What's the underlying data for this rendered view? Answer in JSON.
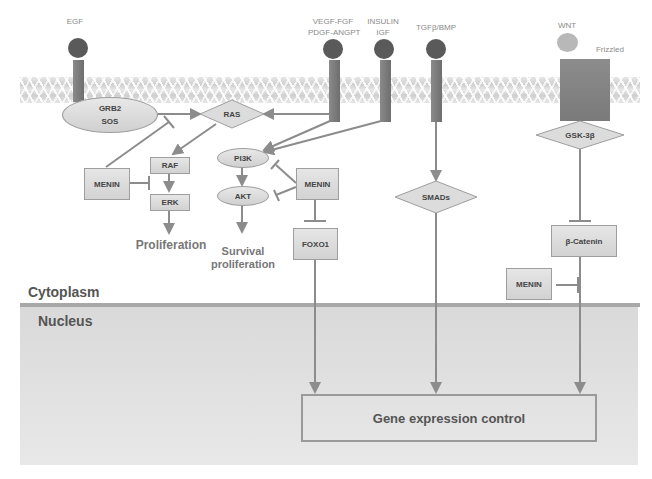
{
  "compartments": {
    "cytoplasm_label": "Cytoplasm",
    "nucleus_label": "Nucleus"
  },
  "ligands": [
    {
      "id": "egf",
      "label": "EGF"
    },
    {
      "id": "vegf",
      "label_line1": "VEGF-FGF",
      "label_line2": "PDGF-ANGPT"
    },
    {
      "id": "insulin",
      "label_line1": "INSULIN",
      "label_line2": "IGF"
    },
    {
      "id": "tgfb",
      "label": "TGFβ/BMP"
    },
    {
      "id": "wnt",
      "label": "WNT"
    }
  ],
  "receptors": {
    "frizzled_label": "Frizzled"
  },
  "nodes": {
    "grb2_sos_line1": "GRB2",
    "grb2_sos_line2": "SOS",
    "ras": "RAS",
    "raf": "RAF",
    "erk": "ERK",
    "menin_left": "MENIN",
    "pi3k": "PI3K",
    "akt": "AKT",
    "menin_middle": "MENIN",
    "foxo1": "FOXO1",
    "smads": "SMADs",
    "gsk3b": "GSK-3β",
    "beta_catenin": "β-Catenin",
    "menin_right": "MENIN",
    "gene_expression": "Gene expression control"
  },
  "outcomes": {
    "proliferation": "Proliferation",
    "survival_line1": "Survival",
    "survival_line2": "proliferation"
  },
  "colors": {
    "arrow": "#8c8c8c",
    "ligand_dark": "#5a5a5a",
    "wnt_ligand": "#b8b8b8",
    "nucleus_fill": "#dedede"
  }
}
